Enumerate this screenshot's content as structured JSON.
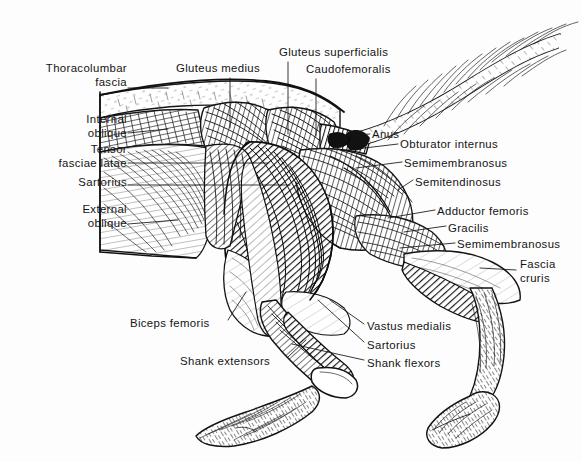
{
  "plate": {
    "subject": "Hindquarters musculature, superficial lateral dissection",
    "width": 582,
    "height": 462,
    "background_color": "#fdfdfd",
    "ink_color": "#141414",
    "style": "pen-and-ink hatched anatomical engraving"
  },
  "labels": [
    {
      "id": "thoracolumbar-fascia",
      "line1": "Thoracolumbar",
      "line2": "fascia",
      "align": "right",
      "x": 22,
      "y": 62,
      "w": 105
    },
    {
      "id": "gluteus-medius",
      "line1": "Gluteus medius",
      "line2": "",
      "align": "left",
      "x": 176,
      "y": 62,
      "w": 110
    },
    {
      "id": "gluteus-superficialis",
      "line1": "Gluteus superficialis",
      "line2": "",
      "align": "left",
      "x": 279,
      "y": 46,
      "w": 125
    },
    {
      "id": "caudofemoralis",
      "line1": "Caudofemoralis",
      "line2": "",
      "align": "left",
      "x": 306,
      "y": 63,
      "w": 100
    },
    {
      "id": "internal-oblique",
      "line1": "Internal",
      "line2": "oblique",
      "align": "right",
      "x": 38,
      "y": 113,
      "w": 89
    },
    {
      "id": "tensor-fasciae-latae",
      "line1": "Tensor",
      "line2": "fasciae latae",
      "align": "right",
      "x": 30,
      "y": 143,
      "w": 97
    },
    {
      "id": "sartorius-upper",
      "line1": "Sartorius",
      "line2": "",
      "align": "right",
      "x": 44,
      "y": 176,
      "w": 83
    },
    {
      "id": "external-oblique",
      "line1": "External",
      "line2": "oblique",
      "align": "right",
      "x": 38,
      "y": 203,
      "w": 89
    },
    {
      "id": "anus",
      "line1": "Anus",
      "line2": "",
      "align": "left",
      "x": 372,
      "y": 128,
      "w": 36
    },
    {
      "id": "obturator-internus",
      "line1": "Obturator internus",
      "line2": "",
      "align": "left",
      "x": 400,
      "y": 138,
      "w": 118
    },
    {
      "id": "semimembranosus-upper",
      "line1": "Semimembranosus",
      "line2": "",
      "align": "left",
      "x": 404,
      "y": 157,
      "w": 120
    },
    {
      "id": "semitendinosus",
      "line1": "Semitendinosus",
      "line2": "",
      "align": "left",
      "x": 415,
      "y": 176,
      "w": 104
    },
    {
      "id": "adductor-femoris",
      "line1": "Adductor femoris",
      "line2": "",
      "align": "left",
      "x": 437,
      "y": 205,
      "w": 113
    },
    {
      "id": "gracilis",
      "line1": "Gracilis",
      "line2": "",
      "align": "left",
      "x": 448,
      "y": 222,
      "w": 55
    },
    {
      "id": "semimembranosus-lower",
      "line1": "Semimembranosus",
      "line2": "",
      "align": "left",
      "x": 457,
      "y": 238,
      "w": 120
    },
    {
      "id": "fascia-cruris",
      "line1": "Fascia",
      "line2": "cruris",
      "align": "left",
      "x": 520,
      "y": 258,
      "w": 55
    },
    {
      "id": "biceps-femoris",
      "line1": "Biceps femoris",
      "line2": "",
      "align": "left",
      "x": 130,
      "y": 317,
      "w": 96
    },
    {
      "id": "vastus-medialis",
      "line1": "Vastus medialis",
      "line2": "",
      "align": "left",
      "x": 367,
      "y": 320,
      "w": 101
    },
    {
      "id": "sartorius-lower",
      "line1": "Sartorius",
      "line2": "",
      "align": "left",
      "x": 367,
      "y": 339,
      "w": 65
    },
    {
      "id": "shank-extensors",
      "line1": "Shank extensors",
      "line2": "",
      "align": "left",
      "x": 180,
      "y": 355,
      "w": 106
    },
    {
      "id": "shank-flexors",
      "line1": "Shank flexors",
      "line2": "",
      "align": "left",
      "x": 367,
      "y": 357,
      "w": 88
    }
  ],
  "leaders": [
    {
      "id": "leader-thoracolumbar-fascia",
      "path": "M128,88 L168,88"
    },
    {
      "id": "leader-gluteus-medius",
      "path": "M230,78 L230,128"
    },
    {
      "id": "leader-gluteus-superficialis",
      "path": "M288,62 L288,134"
    },
    {
      "id": "leader-caudofemoralis",
      "path": "M316,79 L316,136"
    },
    {
      "id": "leader-internal-oblique",
      "path": "M128,133 L168,129"
    },
    {
      "id": "leader-tensor-fasciae-latae",
      "path": "M128,163 L268,163"
    },
    {
      "id": "leader-sartorius-upper",
      "path": "M128,185 L290,185"
    },
    {
      "id": "leader-external-oblique",
      "path": "M128,224 L178,220"
    },
    {
      "id": "leader-anus",
      "path": "M370,134 L344,136"
    },
    {
      "id": "leader-obturator-internus",
      "path": "M398,144 L348,150"
    },
    {
      "id": "leader-semimembranosus-upper",
      "path": "M402,162 L356,168"
    },
    {
      "id": "leader-semitendinosus",
      "path": "M413,180 L398,190"
    },
    {
      "id": "leader-adductor-femoris",
      "path": "M435,210 L388,218"
    },
    {
      "id": "leader-gracilis",
      "path": "M446,226 L404,232"
    },
    {
      "id": "leader-semimembranosus-lower",
      "path": "M455,243 L400,248"
    },
    {
      "id": "leader-fascia-cruris",
      "path": "M516,270 L480,268"
    },
    {
      "id": "leader-biceps-femoris",
      "path": "M228,320 L246,292"
    },
    {
      "id": "leader-vastus-medialis",
      "path": "M364,324 L330,300"
    },
    {
      "id": "leader-sartorius-lower",
      "path": "M364,342 L318,300"
    },
    {
      "id": "leader-shank-extensors",
      "path": "M288,357 L306,340"
    },
    {
      "id": "leader-shank-flexors",
      "path": "M364,360 L292,344"
    }
  ]
}
